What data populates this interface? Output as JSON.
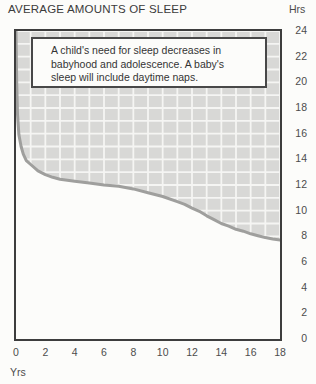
{
  "title": "AVERAGE AMOUNTS OF SLEEP",
  "y_axis_unit": "Hrs",
  "x_axis_unit": "Yrs",
  "annotation": {
    "line1": "A child's need for sleep decreases in",
    "line2": "babyhood and adolescence. A baby's",
    "line3": "sleep will include daytime naps."
  },
  "colors": {
    "background": "#fcfcfa",
    "grid_fill": "#d8d8d6",
    "grid_line": "#f5f5f3",
    "curve": "#9f9f9d",
    "border": "#3d3d3d",
    "label": "#4c4c4c"
  },
  "chart_data": {
    "type": "area",
    "title": "AVERAGE AMOUNTS OF SLEEP",
    "xlabel": "Yrs",
    "ylabel": "Hrs",
    "xlim": [
      0,
      18
    ],
    "ylim": [
      0,
      24
    ],
    "xticks": [
      0,
      2,
      4,
      6,
      8,
      10,
      12,
      14,
      16,
      18
    ],
    "yticks": [
      24,
      22,
      20,
      18,
      16,
      14,
      12,
      10,
      8,
      6,
      4,
      2,
      0
    ],
    "grid": true,
    "grid_step": {
      "x": 1,
      "y": 1
    },
    "legend_position": "none",
    "shading_note": "region above curve is shaded grey grid; region below curve is white",
    "annotation": "A child's need for sleep decreases in babyhood and adolescence. A baby's sleep will include daytime naps.",
    "series": [
      {
        "name": "average hours of sleep by age",
        "points": [
          [
            0,
            24
          ],
          [
            0.05,
            20
          ],
          [
            0.1,
            17.5
          ],
          [
            0.2,
            15.9
          ],
          [
            0.35,
            15.0
          ],
          [
            0.5,
            14.4
          ],
          [
            0.7,
            13.9
          ],
          [
            1,
            13.6
          ],
          [
            1.5,
            13.1
          ],
          [
            2,
            12.8
          ],
          [
            2.5,
            12.6
          ],
          [
            3,
            12.45
          ],
          [
            4,
            12.3
          ],
          [
            5,
            12.15
          ],
          [
            6,
            12.0
          ],
          [
            7,
            11.9
          ],
          [
            8,
            11.7
          ],
          [
            9,
            11.4
          ],
          [
            10,
            11.1
          ],
          [
            11,
            10.7
          ],
          [
            11.5,
            10.5
          ],
          [
            12,
            10.2
          ],
          [
            12.5,
            9.95
          ],
          [
            13,
            9.6
          ],
          [
            13.5,
            9.3
          ],
          [
            14,
            9.0
          ],
          [
            14.5,
            8.8
          ],
          [
            15,
            8.55
          ],
          [
            15.5,
            8.4
          ],
          [
            16,
            8.2
          ],
          [
            16.5,
            8.05
          ],
          [
            17,
            7.9
          ],
          [
            17.5,
            7.8
          ],
          [
            18,
            7.72
          ]
        ]
      }
    ]
  }
}
